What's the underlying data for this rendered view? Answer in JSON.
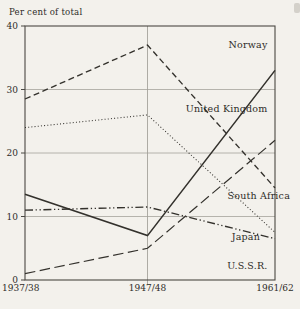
{
  "figure": {
    "kind": "scanned-book-line-chart"
  },
  "colors": {
    "paper": "#f3f1ec",
    "ink": "#33312c",
    "grid": "#a09e97",
    "frame": "#4a4843"
  },
  "chart_data": {
    "type": "line",
    "title": "Per cent of total",
    "xlabel": "",
    "ylabel": "Per cent of total",
    "categories": [
      "1937/38",
      "1947/48",
      "1961/62"
    ],
    "x_frac": [
      0,
      0.49,
      1
    ],
    "y_ticks": [
      0,
      10,
      20,
      30,
      40
    ],
    "ylim": [
      0,
      40
    ],
    "grid": "horizontal lines at 10/20/30, vertical line at middle category, full frame box",
    "legend_position": "inline-labels-on-lines",
    "series": [
      {
        "name": "Norway",
        "values": [
          28.5,
          37,
          14.5
        ],
        "style": "dashed",
        "label": {
          "cx": 0.97,
          "cy": 36.6,
          "anchor": "end"
        }
      },
      {
        "name": "United Kingdom",
        "values": [
          24,
          26,
          7.5
        ],
        "style": "dotted",
        "label": {
          "cx": 0.97,
          "cy": 26.4,
          "anchor": "end"
        }
      },
      {
        "name": "Japan",
        "values": [
          13.5,
          7,
          33
        ],
        "style": "solid",
        "label": {
          "cx": 0.94,
          "cy": 6.3,
          "anchor": "end"
        }
      },
      {
        "name": "South Africa",
        "values": [
          11,
          11.5,
          6.5
        ],
        "style": "dash-dot-dot",
        "label": {
          "cx": 1.06,
          "cy": 12.7,
          "anchor": "end"
        }
      },
      {
        "name": "U.S.S.R.",
        "values": [
          1,
          5,
          22
        ],
        "style": "long-dash",
        "label": {
          "cx": 0.97,
          "cy": 1.8,
          "anchor": "end"
        }
      }
    ]
  }
}
